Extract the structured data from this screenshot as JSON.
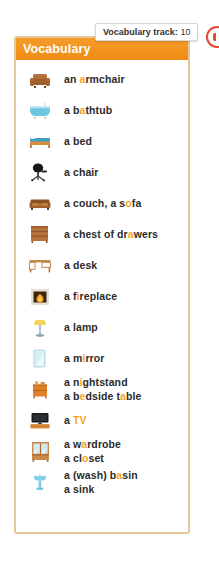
{
  "panel": {
    "header_title": "Vocabulary"
  },
  "tooltip": {
    "label": "Vocabulary track:",
    "value": "10"
  },
  "audio_badge": {
    "icon": "speaker-icon",
    "color": "#e8472e"
  },
  "colors": {
    "header_start": "#f59c2a",
    "header_end": "#ee8c14",
    "border": "#e8c898",
    "highlight": "#f5a623",
    "text": "#2b2b2b"
  },
  "vocab_items": [
    {
      "icon": "armchair-icon",
      "lines": [
        {
          "parts": [
            {
              "t": "an ",
              "hl": false
            },
            {
              "t": "a",
              "hl": true
            },
            {
              "t": "rmchair",
              "hl": false
            }
          ]
        }
      ]
    },
    {
      "icon": "bathtub-icon",
      "lines": [
        {
          "parts": [
            {
              "t": "a b",
              "hl": false
            },
            {
              "t": "a",
              "hl": true
            },
            {
              "t": "thtub",
              "hl": false
            }
          ]
        }
      ]
    },
    {
      "icon": "bed-icon",
      "lines": [
        {
          "parts": [
            {
              "t": "a bed",
              "hl": false
            }
          ]
        }
      ]
    },
    {
      "icon": "office-chair-icon",
      "lines": [
        {
          "parts": [
            {
              "t": "a chair",
              "hl": false
            }
          ]
        }
      ]
    },
    {
      "icon": "couch-icon",
      "lines": [
        {
          "parts": [
            {
              "t": "a couch, a s",
              "hl": false
            },
            {
              "t": "o",
              "hl": true
            },
            {
              "t": "fa",
              "hl": false
            }
          ]
        }
      ]
    },
    {
      "icon": "chest-of-drawers-icon",
      "lines": [
        {
          "parts": [
            {
              "t": "a chest of dr",
              "hl": false
            },
            {
              "t": "a",
              "hl": true
            },
            {
              "t": "wers",
              "hl": false
            }
          ]
        }
      ]
    },
    {
      "icon": "desk-icon",
      "lines": [
        {
          "parts": [
            {
              "t": "a desk",
              "hl": false
            }
          ]
        }
      ]
    },
    {
      "icon": "fireplace-icon",
      "lines": [
        {
          "parts": [
            {
              "t": "a f",
              "hl": false
            },
            {
              "t": "i",
              "hl": true
            },
            {
              "t": "replace",
              "hl": false
            }
          ]
        }
      ]
    },
    {
      "icon": "lamp-icon",
      "lines": [
        {
          "parts": [
            {
              "t": "a lamp",
              "hl": false
            }
          ]
        }
      ]
    },
    {
      "icon": "mirror-icon",
      "lines": [
        {
          "parts": [
            {
              "t": "a m",
              "hl": false
            },
            {
              "t": "i",
              "hl": true
            },
            {
              "t": "rror",
              "hl": false
            }
          ]
        }
      ]
    },
    {
      "icon": "nightstand-icon",
      "lines": [
        {
          "parts": [
            {
              "t": "a n",
              "hl": false
            },
            {
              "t": "i",
              "hl": true
            },
            {
              "t": "ghtstand",
              "hl": false
            }
          ]
        },
        {
          "parts": [
            {
              "t": "a b",
              "hl": false
            },
            {
              "t": "e",
              "hl": true
            },
            {
              "t": "dside t",
              "hl": false
            },
            {
              "t": "a",
              "hl": true
            },
            {
              "t": "ble",
              "hl": false
            }
          ]
        }
      ]
    },
    {
      "icon": "tv-icon",
      "lines": [
        {
          "parts": [
            {
              "t": "a ",
              "hl": false
            },
            {
              "t": "TV",
              "hl": true
            }
          ]
        }
      ]
    },
    {
      "icon": "wardrobe-icon",
      "lines": [
        {
          "parts": [
            {
              "t": "a w",
              "hl": false
            },
            {
              "t": "a",
              "hl": true
            },
            {
              "t": "rdrobe",
              "hl": false
            }
          ]
        },
        {
          "parts": [
            {
              "t": "a cl",
              "hl": false
            },
            {
              "t": "o",
              "hl": true
            },
            {
              "t": "set",
              "hl": false
            }
          ]
        }
      ]
    },
    {
      "icon": "washbasin-icon",
      "lines": [
        {
          "parts": [
            {
              "t": "a (wash) b",
              "hl": false
            },
            {
              "t": "a",
              "hl": true
            },
            {
              "t": "sin",
              "hl": false
            }
          ]
        },
        {
          "parts": [
            {
              "t": "a sink",
              "hl": false
            }
          ]
        }
      ]
    }
  ]
}
